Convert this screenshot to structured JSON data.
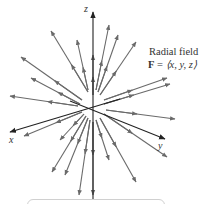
{
  "figure": {
    "title": "Radial field",
    "formula": {
      "lhs": "F",
      "eq": " = ",
      "rhs": "⟨x, y, z⟩"
    },
    "axes": {
      "x_label": "x",
      "y_label": "y",
      "z_label": "z"
    },
    "colors": {
      "arrow": "#6a6a6a",
      "axis": "#222222",
      "text": "#333333",
      "box_border": "#d0d0d0"
    },
    "origin": [
      93,
      108
    ],
    "arrows": [
      {
        "from": [
          88,
          92
        ],
        "to": [
          51,
          31
        ]
      },
      {
        "from": [
          82,
          100
        ],
        "to": [
          21,
          57
        ]
      },
      {
        "from": [
          80,
          104
        ],
        "to": [
          31,
          78
        ]
      },
      {
        "from": [
          78,
          106
        ],
        "to": [
          10,
          96
        ]
      },
      {
        "from": [
          88,
          90
        ],
        "to": [
          77,
          40
        ]
      },
      {
        "from": [
          96,
          90
        ],
        "to": [
          109,
          25
        ]
      },
      {
        "from": [
          98,
          92
        ],
        "to": [
          118,
          35
        ]
      },
      {
        "from": [
          100,
          95
        ],
        "to": [
          136,
          42
        ]
      },
      {
        "from": [
          104,
          100
        ],
        "to": [
          167,
          78
        ]
      },
      {
        "from": [
          104,
          104
        ],
        "to": [
          170,
          84
        ]
      },
      {
        "from": [
          106,
          110
        ],
        "to": [
          175,
          119
        ]
      },
      {
        "from": [
          82,
          112
        ],
        "to": [
          24,
          136
        ]
      },
      {
        "from": [
          86,
          116
        ],
        "to": [
          52,
          172
        ]
      },
      {
        "from": [
          88,
          118
        ],
        "to": [
          65,
          175
        ]
      },
      {
        "from": [
          90,
          120
        ],
        "to": [
          79,
          195
        ]
      },
      {
        "from": [
          96,
          120
        ],
        "to": [
          109,
          160
        ]
      },
      {
        "from": [
          100,
          118
        ],
        "to": [
          136,
          182
        ]
      },
      {
        "from": [
          104,
          114
        ],
        "to": [
          167,
          157
        ]
      },
      {
        "from": [
          84,
          114
        ],
        "to": [
          60,
          140
        ]
      },
      {
        "from": [
          93,
          95
        ],
        "to": [
          93,
          55
        ]
      },
      {
        "from": [
          93,
          122
        ],
        "to": [
          93,
          195
        ]
      }
    ]
  }
}
